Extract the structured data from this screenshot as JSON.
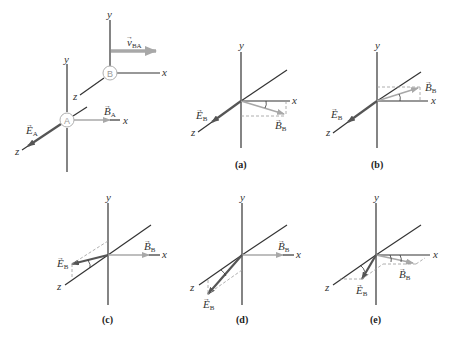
{
  "colors": {
    "axis": "#333333",
    "e_vector": "#555555",
    "b_vector": "#a8a8a8",
    "velocity": "#a8a8a8",
    "dashed": "#9a9a9a",
    "circle": "#b0b0b0"
  },
  "setup": {
    "frame_a": {
      "label": "A",
      "axes": {
        "x": "x",
        "y": "y",
        "z": "z"
      },
      "e_label": "E",
      "e_sub": "A",
      "b_label": "B",
      "b_sub": "A"
    },
    "frame_b": {
      "label": "B",
      "axes": {
        "x": "x",
        "y": "y",
        "z": "z"
      },
      "v_label": "v",
      "v_sub": "BA"
    }
  },
  "panels": [
    {
      "id": "a",
      "caption": "(a)",
      "axes": {
        "x": "x",
        "y": "y",
        "z": "z"
      },
      "e_label": "E",
      "e_sub": "B",
      "b_label": "B",
      "b_sub": "B"
    },
    {
      "id": "b",
      "caption": "(b)",
      "axes": {
        "x": "x",
        "y": "y",
        "z": "z"
      },
      "e_label": "E",
      "e_sub": "B",
      "b_label": "B",
      "b_sub": "B"
    },
    {
      "id": "c",
      "caption": "(c)",
      "axes": {
        "x": "x",
        "y": "y",
        "z": "z"
      },
      "e_label": "E",
      "e_sub": "B",
      "b_label": "B",
      "b_sub": "B"
    },
    {
      "id": "d",
      "caption": "(d)",
      "axes": {
        "x": "x",
        "y": "y",
        "z": "z"
      },
      "e_label": "E",
      "e_sub": "B",
      "b_label": "B",
      "b_sub": "B"
    },
    {
      "id": "e",
      "caption": "(e)",
      "axes": {
        "x": "x",
        "y": "y",
        "z": "z"
      },
      "e_label": "E",
      "e_sub": "B",
      "b_label": "B",
      "b_sub": "B"
    }
  ]
}
